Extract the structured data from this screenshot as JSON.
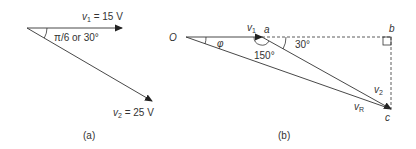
{
  "diagram": {
    "panel_a": {
      "caption": "(a)",
      "v1_label": "v",
      "v1_sub": "1",
      "v1_value": " = 15 V",
      "v2_label": "v",
      "v2_sub": "2",
      "v2_value": " = 25 V",
      "angle_label": "π/6 or 30°"
    },
    "panel_b": {
      "caption": "(b)",
      "origin_label": "O",
      "phi_label": "φ",
      "v1_label": "v",
      "v1_sub": "1",
      "point_a": "a",
      "point_b": "b",
      "point_c": "c",
      "angle_150": "150°",
      "angle_30": "30°",
      "v2_label": "v",
      "v2_sub": "2",
      "vr_label": "v",
      "vr_sub": "R"
    },
    "colors": {
      "line": "#333333",
      "text": "#333333",
      "background": "#ffffff"
    }
  }
}
